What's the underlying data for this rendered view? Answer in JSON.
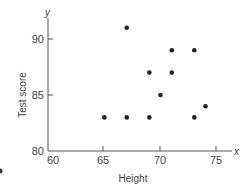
{
  "chart_data": {
    "type": "scatter",
    "title": "",
    "xlabel": "Height",
    "ylabel": "Test score",
    "x_axis_var": "x",
    "y_axis_var": "y",
    "xlim": [
      60,
      76
    ],
    "ylim": [
      80,
      92
    ],
    "x_ticks": [
      60,
      65,
      70,
      75
    ],
    "y_ticks": [
      80,
      85,
      90
    ],
    "grid": false,
    "legend": null,
    "series": [
      {
        "name": "observations",
        "points": [
          {
            "x": 65,
            "y": 83
          },
          {
            "x": 67,
            "y": 83
          },
          {
            "x": 67,
            "y": 91
          },
          {
            "x": 69,
            "y": 83
          },
          {
            "x": 69,
            "y": 87
          },
          {
            "x": 70,
            "y": 85
          },
          {
            "x": 71,
            "y": 87
          },
          {
            "x": 71,
            "y": 89
          },
          {
            "x": 73,
            "y": 83
          },
          {
            "x": 73,
            "y": 89
          },
          {
            "x": 74,
            "y": 84
          }
        ]
      }
    ]
  },
  "labels": {
    "xlabel": "Height",
    "ylabel": "Test score",
    "x_var": "x",
    "y_var": "y",
    "x_tick_60": "60",
    "x_tick_65": "65",
    "x_tick_70": "70",
    "x_tick_75": "75",
    "y_tick_80": "80",
    "y_tick_85": "85",
    "y_tick_90": "90"
  },
  "style": {
    "axis_color": "#555555",
    "point_color": "#222222"
  }
}
